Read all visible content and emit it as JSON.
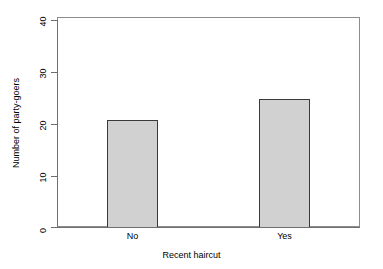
{
  "chart_data": {
    "type": "bar",
    "title": "",
    "subtitle": "",
    "categories": [
      "No",
      "Yes"
    ],
    "values": [
      21,
      25
    ],
    "series": [
      {
        "name": "Number of party-goers",
        "values": [
          21,
          25
        ]
      }
    ],
    "xlabel": "Recent haircut",
    "ylabel": "Number of party-goers",
    "ylim": [
      0,
      41
    ],
    "xlim": [
      0,
      2
    ],
    "yticks": [
      0,
      10,
      20,
      30,
      40
    ],
    "ytick_labels": [
      "0",
      "10",
      "20",
      "30",
      "40"
    ],
    "xtick_labels": [
      "No",
      "Yes"
    ],
    "grid": false,
    "legend": false,
    "legend_position": "none",
    "bar_fill_color": "#d1d1d1",
    "bar_border_color": "#3a3a3a",
    "axis_color": "#6f6f6f",
    "plot_border_color": "#8d8d8d",
    "background_color": "#ffffff",
    "text_color": "#000000"
  },
  "axes": {
    "y": {
      "title": "Number of party-goers",
      "ticks": [
        {
          "value": "40"
        },
        {
          "value": "30"
        },
        {
          "value": "20"
        },
        {
          "value": "10"
        },
        {
          "value": "0"
        }
      ]
    },
    "x": {
      "title": "Recent haircut",
      "ticks": [
        {
          "value": "No"
        },
        {
          "value": "Yes"
        }
      ]
    }
  },
  "bars": [
    {
      "label": "No",
      "value": "21"
    },
    {
      "label": "Yes",
      "value": "25"
    }
  ]
}
